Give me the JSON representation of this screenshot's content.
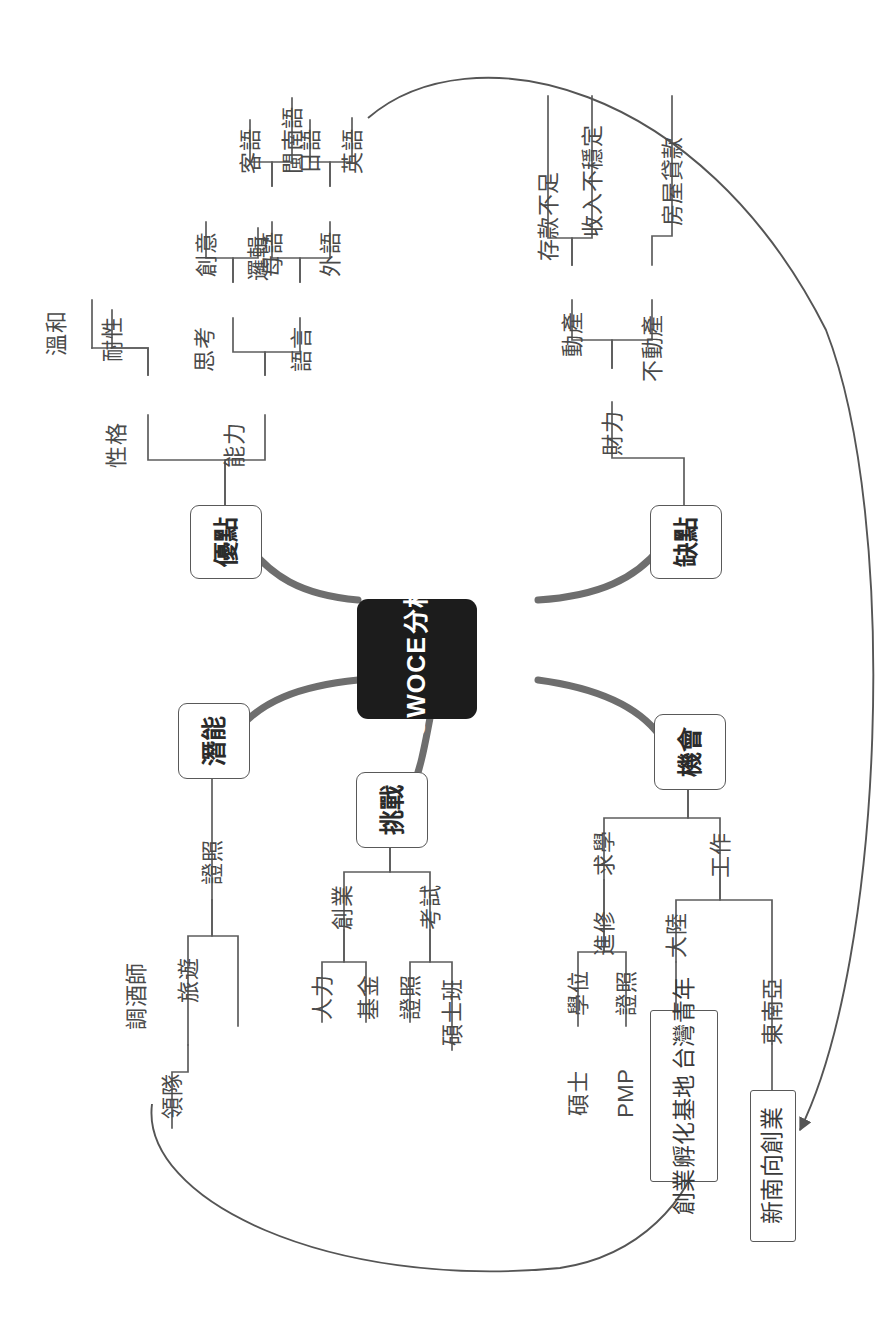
{
  "diagram": {
    "type": "mind-map",
    "orientation": "rotated-90-ccw",
    "colors": {
      "center_fill": "#1c1c1c",
      "center_text": "#ffffff",
      "branch_stroke": "#6e6e6e",
      "node_stroke": "#595959",
      "text": "#3b3b3b",
      "background": "#ffffff"
    },
    "center": {
      "label_en": "SWOCE",
      "label_zh": "分析"
    },
    "branches": [
      {
        "id": "strengths",
        "label": "優點",
        "children": [
          {
            "label": "性格",
            "children": [
              {
                "label": "耐性"
              },
              {
                "label": "溫和"
              }
            ]
          },
          {
            "label": "能力",
            "children": [
              {
                "label": "思考",
                "children": [
                  {
                    "label": "創意"
                  },
                  {
                    "label": "邏輯"
                  }
                ]
              },
              {
                "label": "語言",
                "children": [
                  {
                    "label": "母語",
                    "children": [
                      {
                        "label": "客語"
                      },
                      {
                        "label": "閩南語"
                      }
                    ]
                  },
                  {
                    "label": "外語",
                    "children": [
                      {
                        "label": "英語"
                      },
                      {
                        "label": "日語"
                      }
                    ]
                  }
                ]
              }
            ]
          }
        ]
      },
      {
        "id": "weaknesses",
        "label": "缺點",
        "children": [
          {
            "label": "財力",
            "children": [
              {
                "label": "動產",
                "children": [
                  {
                    "label": "存款不足"
                  },
                  {
                    "label": "收入不穩定"
                  }
                ]
              },
              {
                "label": "不動產",
                "children": [
                  {
                    "label": "房屋貸款"
                  }
                ]
              }
            ]
          }
        ]
      },
      {
        "id": "potential",
        "label": "潛能",
        "children": [
          {
            "label": "證照",
            "children": [
              {
                "label": "旅遊",
                "children": [
                  {
                    "label": "領隊"
                  }
                ]
              },
              {
                "label": "調酒師"
              }
            ]
          }
        ]
      },
      {
        "id": "challenges",
        "label": "挑戰",
        "children": [
          {
            "label": "創業",
            "children": [
              {
                "label": "人力"
              },
              {
                "label": "基金"
              }
            ]
          },
          {
            "label": "考試",
            "children": [
              {
                "label": "證照"
              },
              {
                "label": "碩士班"
              }
            ]
          }
        ]
      },
      {
        "id": "opportunities",
        "label": "機會",
        "children": [
          {
            "label": "求學",
            "children": [
              {
                "label": "進修",
                "children": [
                  {
                    "label": "學位",
                    "children": [
                      {
                        "label": "碩士"
                      }
                    ]
                  },
                  {
                    "label": "證照",
                    "children": [
                      {
                        "label": "PMP"
                      }
                    ]
                  }
                ]
              }
            ]
          },
          {
            "label": "工作",
            "children": [
              {
                "label": "大陸",
                "children": [
                  {
                    "label": "台灣青年",
                    "label2": "創業孵化基地"
                  }
                ]
              },
              {
                "label": "東南亞",
                "children": [
                  {
                    "label": "新南向創業"
                  }
                ]
              }
            ]
          }
        ]
      }
    ],
    "cross_links": [
      {
        "from": "英語",
        "to": "新南向創業",
        "style": "curved-arrow"
      },
      {
        "from": "領隊",
        "to": "台灣青年創業孵化基地",
        "style": "curved-arrow"
      }
    ]
  },
  "labels": {
    "center_en": "SWOCE",
    "center_zh": "分析",
    "strengths": "優點",
    "personality": "性格",
    "patience": "耐性",
    "gentle": "溫和",
    "ability": "能力",
    "thinking": "思考",
    "creativity": "創意",
    "logic": "邏輯",
    "language": "語言",
    "mother_tongue": "母語",
    "hakka": "客語",
    "minnan": "閩南語",
    "foreign_lang": "外語",
    "english": "英語",
    "japanese": "日語",
    "weaknesses": "缺點",
    "finance": "財力",
    "movable": "動產",
    "savings_short": "存款不足",
    "income_unstable": "收入不穩定",
    "immovable": "不動產",
    "house_loan": "房屋貸款",
    "potential": "潛能",
    "license_p": "證照",
    "travel": "旅遊",
    "tour_leader": "領隊",
    "bartender": "調酒師",
    "challenges": "挑戰",
    "startup": "創業",
    "manpower": "人力",
    "fund": "基金",
    "exam": "考試",
    "license_c": "證照",
    "master_class": "碩士班",
    "opportunities": "機會",
    "study": "求學",
    "further_study": "進修",
    "degree": "學位",
    "master": "碩士",
    "license_o": "證照",
    "pmp": "PMP",
    "work": "工作",
    "mainland": "大陸",
    "tw_youth_1": "台灣青年",
    "tw_youth_2": "創業孵化基地",
    "sea": "東南亞",
    "new_southbound": "新南向創業"
  }
}
